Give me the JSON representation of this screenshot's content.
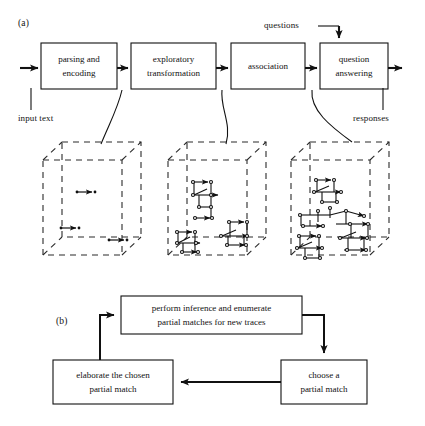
{
  "figure": {
    "panels": [
      {
        "id": "a",
        "label": "(a)"
      },
      {
        "id": "b",
        "label": "(b)"
      }
    ]
  },
  "panel_a": {
    "label": "(a)",
    "pipeline_boxes": [
      {
        "name": "parsing-encoding",
        "line1": "parsing and",
        "line2": "encoding"
      },
      {
        "name": "exploratory-transformation",
        "line1": "exploratory",
        "line2": "transformation"
      },
      {
        "name": "association",
        "line1": "association",
        "line2": ""
      },
      {
        "name": "question-answering",
        "line1": "question",
        "line2": "answering"
      }
    ],
    "input_label": "input text",
    "output_label": "responses",
    "questions_label": "questions",
    "memory_cubes": [
      {
        "name": "memory-state-1",
        "trace_count": 3
      },
      {
        "name": "memory-state-2",
        "trace_count": 4
      },
      {
        "name": "memory-state-3",
        "trace_count": 6
      }
    ]
  },
  "panel_b": {
    "label": "(b)",
    "boxes": [
      {
        "name": "perform-inference",
        "line1": "perform inference and enumerate",
        "line2": "partial matches for new traces"
      },
      {
        "name": "choose-partial-match",
        "line1": "choose a",
        "line2": "partial match"
      },
      {
        "name": "elaborate-partial-match",
        "line1": "elaborate the chosen",
        "line2": "partial match"
      }
    ]
  },
  "colors": {
    "ink": "#111111",
    "background": "#ffffff",
    "dashed": "#2a2a2a"
  }
}
